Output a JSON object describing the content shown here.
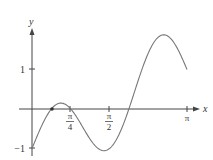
{
  "chart_data": {
    "type": "line",
    "title": "",
    "xlabel": "x",
    "ylabel": "y",
    "function": "y = sin(3x) - cos(x)",
    "x_range": [
      0,
      3.14159
    ],
    "ylim": [
      -1.1,
      2.1
    ],
    "x_ticks": [
      {
        "value": 0.7854,
        "label_num": "π",
        "label_den": "4"
      },
      {
        "value": 1.5708,
        "label_num": "π",
        "label_den": "2"
      },
      {
        "value": 3.14159,
        "label": "π"
      }
    ],
    "y_ticks": [
      {
        "value": 1,
        "label": "1"
      },
      {
        "value": -1,
        "label": "−1"
      }
    ],
    "marked_points": [
      {
        "x": 0.405,
        "y": 0
      }
    ],
    "series": [
      {
        "name": "f(x)",
        "x": [
          0,
          0.2,
          0.405,
          0.55,
          0.7854,
          1.0,
          1.3,
          1.5708,
          1.8,
          2.0,
          2.2,
          2.4,
          2.6,
          2.75,
          2.9,
          3.14159
        ],
        "y": [
          -1.0,
          -0.416,
          0.02,
          0.145,
          0.0,
          -0.399,
          -0.955,
          -1.0,
          -0.545,
          0.137,
          0.903,
          1.53,
          1.862,
          1.843,
          1.603,
          1.0
        ]
      }
    ],
    "grid": false,
    "legend": null
  },
  "labels": {
    "x_axis": "x",
    "y_axis": "y",
    "tick_pi4_num": "π",
    "tick_pi4_den": "4",
    "tick_pi2_num": "π",
    "tick_pi2_den": "2",
    "tick_pi": "π",
    "tick_one": "1",
    "tick_neg_one": "−1"
  }
}
